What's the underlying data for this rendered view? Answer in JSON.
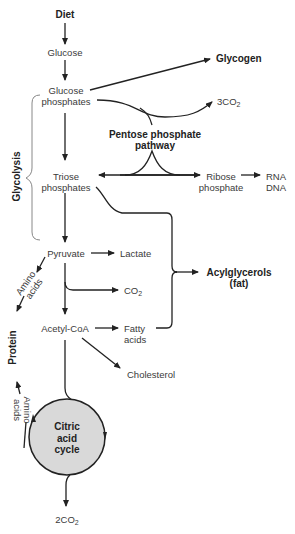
{
  "diagram": {
    "nodes": {
      "diet": "Diet",
      "glucose": "Glucose",
      "glycogen": "Glycogen",
      "glucose_phosphates_1": "Glucose",
      "glucose_phosphates_2": "phosphates",
      "co2_3": "3CO",
      "co2_3_sub": "2",
      "pentose_1": "Pentose phosphate",
      "pentose_2": "pathway",
      "glycolysis": "Glycolysis",
      "triose_1": "Triose",
      "triose_2": "phosphates",
      "ribose_1": "Ribose",
      "ribose_2": "phosphate",
      "rna": "RNA",
      "dna": "DNA",
      "pyruvate": "Pyruvate",
      "lactate": "Lactate",
      "acylglycerols_1": "Acylglycerols",
      "acylglycerols_2": "(fat)",
      "amino_acids_top_1": "Amino",
      "amino_acids_top_2": "acids",
      "co2": "CO",
      "co2_sub": "2",
      "protein": "Protein",
      "acetyl_coa": "Acetyl-CoA",
      "fatty_1": "Fatty",
      "fatty_2": "acids",
      "cholesterol": "Cholesterol",
      "amino_acids_bottom_1": "Amino",
      "amino_acids_bottom_2": "acids",
      "citric_1": "Citric",
      "citric_2": "acid",
      "citric_3": "cycle",
      "co2_2": "2CO",
      "co2_2_sub": "2"
    },
    "colors": {
      "line": "#222222",
      "cycle_fill": "#d9d9d9",
      "bracket": "#888888"
    }
  }
}
